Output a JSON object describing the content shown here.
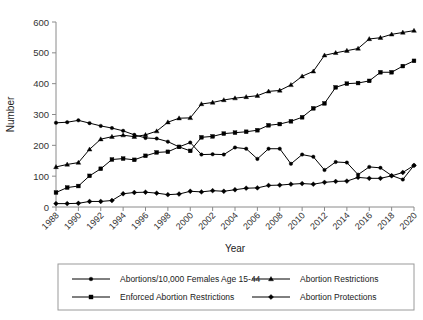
{
  "chart_data": {
    "type": "line",
    "title": "",
    "xlabel": "Year",
    "ylabel": "Number",
    "xlim": [
      1988,
      2020
    ],
    "ylim": [
      0,
      600
    ],
    "ytick_labels": [
      "0",
      "100",
      "200",
      "300",
      "400",
      "500",
      "600"
    ],
    "yticks": [
      0,
      100,
      200,
      300,
      400,
      500,
      600
    ],
    "xtick_labels": [
      "1988",
      "1990",
      "1992",
      "1994",
      "1996",
      "1998",
      "2000",
      "2002",
      "2004",
      "2006",
      "2008",
      "2010",
      "2012",
      "2014",
      "2016",
      "2018",
      "2020"
    ],
    "xticks": [
      1988,
      1990,
      1992,
      1994,
      1996,
      1998,
      2000,
      2002,
      2004,
      2006,
      2008,
      2010,
      2012,
      2014,
      2016,
      2018,
      2020
    ],
    "grid": false,
    "legend_position": "below",
    "x": [
      1988,
      1989,
      1990,
      1991,
      1992,
      1993,
      1994,
      1995,
      1996,
      1997,
      1998,
      1999,
      2000,
      2001,
      2002,
      2003,
      2004,
      2005,
      2006,
      2007,
      2008,
      2009,
      2010,
      2011,
      2012,
      2013,
      2014,
      2015,
      2016,
      2017,
      2018,
      2019,
      2020
    ],
    "series": [
      {
        "name": "Abortions/10,000 Females Age 15-44",
        "marker": "circle",
        "values": [
          273,
          275,
          281,
          272,
          263,
          256,
          247,
          234,
          224,
          222,
          212,
          195,
          209,
          170,
          171,
          170,
          193,
          189,
          156,
          189,
          189,
          140,
          170,
          163,
          120,
          146,
          144,
          105,
          130,
          127,
          102,
          89,
          135
        ]
      },
      {
        "name": "Enforced Abortion Restrictions",
        "marker": "square",
        "values": [
          47,
          63,
          68,
          101,
          124,
          154,
          157,
          153,
          166,
          177,
          179,
          195,
          182,
          226,
          229,
          238,
          241,
          244,
          249,
          265,
          269,
          278,
          291,
          320,
          336,
          388,
          400,
          402,
          409,
          437,
          437,
          457,
          474
        ]
      },
      {
        "name": "Abortion Restrictions",
        "marker": "triangle",
        "values": [
          130,
          138,
          144,
          187,
          220,
          228,
          233,
          228,
          234,
          246,
          275,
          288,
          289,
          334,
          339,
          347,
          353,
          357,
          361,
          375,
          378,
          396,
          424,
          440,
          492,
          500,
          507,
          514,
          545,
          549,
          560,
          566,
          572
        ]
      },
      {
        "name": "Abortion Protections",
        "marker": "diamond",
        "values": [
          11,
          11,
          12,
          18,
          18,
          21,
          43,
          47,
          48,
          45,
          40,
          42,
          51,
          49,
          53,
          51,
          56,
          61,
          62,
          70,
          71,
          74,
          76,
          74,
          80,
          83,
          84,
          96,
          93,
          93,
          101,
          112,
          135
        ]
      }
    ]
  },
  "legend": {
    "entries": [
      {
        "label": "Abortions/10,000 Females Age 15-44",
        "marker": "circle"
      },
      {
        "label": "Abortion Restrictions",
        "marker": "triangle"
      },
      {
        "label": "Enforced Abortion Restrictions",
        "marker": "square"
      },
      {
        "label": "Abortion Protections",
        "marker": "diamond"
      }
    ]
  }
}
